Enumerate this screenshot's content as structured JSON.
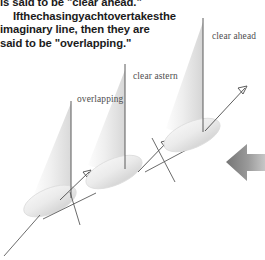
{
  "page": {
    "width": 265,
    "height": 260,
    "background": "#ffffff"
  },
  "body_text": {
    "lines": [
      "is said to be \"clear ahead.\"",
      "If the chasing yacht overtakes the",
      "imaginary line, then they are",
      "said to be \"overlapping.\""
    ],
    "line_1_words": [
      "If",
      "the",
      "chasing",
      "yacht",
      "overtakes",
      "the"
    ],
    "color": "#1b1b1b"
  },
  "diagram": {
    "labels": [
      {
        "id": "clear-ahead",
        "text": "clear ahead"
      },
      {
        "id": "clear-astern",
        "text": "clear astern"
      },
      {
        "id": "overlapping",
        "text": "overlapping"
      }
    ],
    "label_color": "#4e4e4e",
    "sail_fill_light": "#f2f2f2",
    "sail_fill_mid": "#e2e2e2",
    "hull_fill": "#ececec",
    "hull_stroke": "#d2d2d2",
    "line_color": "#555555",
    "wind_arrow_color": "#8e8e8e",
    "wind_arrow_direction": "left",
    "yachts": [
      {
        "name": "yacht-overlapping",
        "position": "lower-left"
      },
      {
        "name": "yacht-clear-astern",
        "position": "middle"
      },
      {
        "name": "yacht-clear-ahead",
        "position": "upper-right"
      }
    ]
  }
}
